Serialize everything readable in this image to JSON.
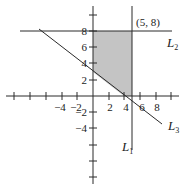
{
  "diagram": {
    "type": "coordinate-plane",
    "colors": {
      "line": "#2a2a2a",
      "shade": "#c4c4c4",
      "background": "#ffffff"
    },
    "x_tick_labels": [
      {
        "value": -4,
        "label": "−4"
      },
      {
        "value": -2,
        "label": "−2"
      },
      {
        "value": 2,
        "label": "2"
      },
      {
        "value": 4,
        "label": "4"
      },
      {
        "value": 6,
        "label": "6"
      },
      {
        "value": 8,
        "label": "8"
      }
    ],
    "y_tick_labels": [
      {
        "value": 8,
        "label": "8"
      },
      {
        "value": 6,
        "label": "6"
      },
      {
        "value": 4,
        "label": "4"
      },
      {
        "value": 2,
        "label": "2"
      },
      {
        "value": -2,
        "label": "−2"
      },
      {
        "value": -4,
        "label": "−4"
      }
    ],
    "lines": [
      {
        "name": "L1",
        "letter": "L",
        "sub": "1",
        "equation": "x = 5"
      },
      {
        "name": "L2",
        "letter": "L",
        "sub": "2",
        "equation": "y = 8"
      },
      {
        "name": "L3",
        "letter": "L",
        "sub": "3",
        "equation": "3x + 4y = 12"
      }
    ],
    "point": {
      "label": "(5, 8)",
      "x": 5,
      "y": 8
    },
    "shaded_region": {
      "vertices": [
        [
          0,
          3
        ],
        [
          0,
          8
        ],
        [
          5,
          8
        ],
        [
          5,
          0
        ],
        [
          4,
          0
        ]
      ]
    }
  }
}
